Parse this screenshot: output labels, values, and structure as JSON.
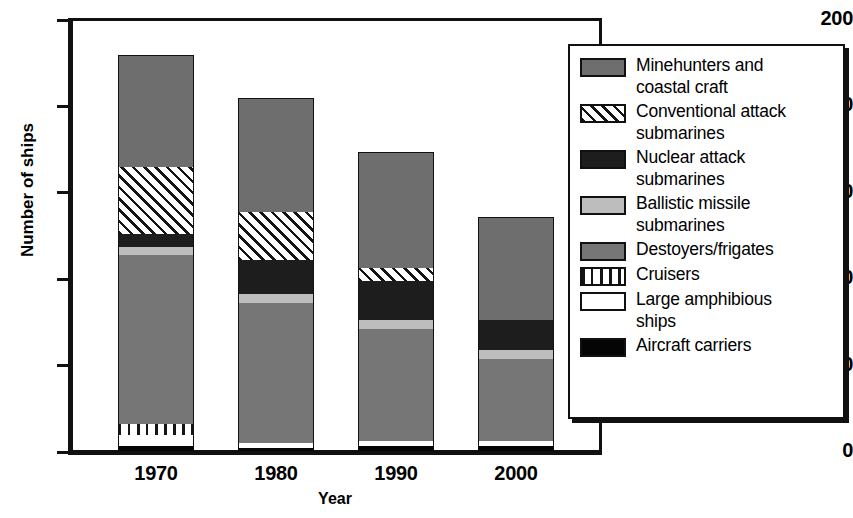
{
  "chart_data": {
    "type": "bar",
    "subtype": "stacked-bar",
    "title": "",
    "xlabel": "Year",
    "ylabel": "Number of ships",
    "categories": [
      "1970",
      "1980",
      "1990",
      "2000"
    ],
    "ylim": [
      0,
      200
    ],
    "yticks": [
      0,
      40,
      80,
      120,
      160,
      200
    ],
    "grid": false,
    "legend_position": "right-inside",
    "stack_order_bottom_to_top": [
      "Aircraft carriers",
      "Large amphibious ships",
      "Cruisers",
      "Destoyers/frigates",
      "Ballistic missile submarines",
      "Nuclear attack submarines",
      "Conventional attack submarines",
      "Minehunters and coastal craft"
    ],
    "series": [
      {
        "name": "Aircraft carriers",
        "values": [
          3,
          2,
          3,
          3
        ]
      },
      {
        "name": "Large amphibious ships",
        "values": [
          5,
          2,
          2,
          2
        ]
      },
      {
        "name": "Cruisers",
        "values": [
          5,
          0,
          0,
          0
        ]
      },
      {
        "name": "Destoyers/frigates",
        "values": [
          78,
          65,
          52,
          38
        ]
      },
      {
        "name": "Ballistic missile submarines",
        "values": [
          4,
          4,
          4,
          4
        ]
      },
      {
        "name": "Nuclear attack submarines",
        "values": [
          6,
          16,
          18,
          14
        ]
      },
      {
        "name": "Conventional attack submarines",
        "values": [
          31,
          22,
          6,
          0
        ]
      },
      {
        "name": "Minehunters and coastal craft",
        "values": [
          52,
          53,
          54,
          48
        ]
      }
    ],
    "totals": [
      184,
      164,
      139,
      109
    ]
  },
  "axes": {
    "y_title": "Number of ships",
    "x_title": "Year",
    "y_tick_labels": [
      "200",
      "160",
      "120",
      "80",
      "40",
      "0"
    ],
    "x_tick_labels": [
      "1970",
      "1980",
      "1990",
      "2000"
    ]
  },
  "legend": {
    "entries": [
      {
        "label": "Minehunters and\ncoastal craft",
        "swatch": "minehunters",
        "color": "#6e6e6e"
      },
      {
        "label": "Conventional attack\nsubmarines",
        "swatch": "conventional",
        "color": "#ffffff"
      },
      {
        "label": "Nuclear attack\nsubmarines",
        "swatch": "nuclear",
        "color": "#1d1d1d"
      },
      {
        "label": "Ballistic missile\nsubmarines",
        "swatch": "ballistic",
        "color": "#bdbdbd"
      },
      {
        "label": "Destoyers/frigates",
        "swatch": "destroyers",
        "color": "#767676"
      },
      {
        "label": "Cruisers",
        "swatch": "cruisers",
        "color": "#ffffff"
      },
      {
        "label": "Large amphibious\nships",
        "swatch": "amphibious",
        "color": "#ffffff"
      },
      {
        "label": "Aircraft carriers",
        "swatch": "carriers",
        "color": "#050505"
      }
    ]
  },
  "colors": {
    "axis": "#111111",
    "minehunters": "#6e6e6e",
    "destroyers": "#767676",
    "nuclear": "#1d1d1d",
    "ballistic": "#bdbdbd",
    "carriers": "#050505",
    "amphibious": "#ffffff",
    "background": "#ffffff"
  }
}
